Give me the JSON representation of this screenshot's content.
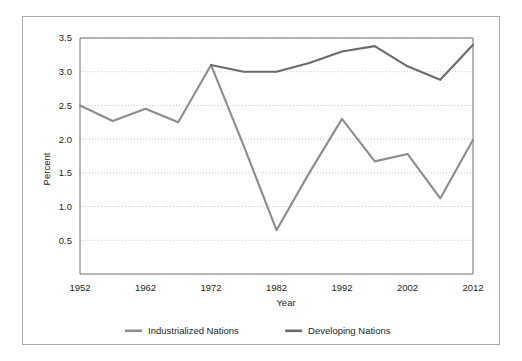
{
  "chart_data": {
    "type": "line",
    "title": "",
    "xlabel": "Year",
    "ylabel": "Percent",
    "xlim": [
      1952,
      2012
    ],
    "ylim": [
      0,
      3.5
    ],
    "xticks": [
      1952,
      1962,
      1972,
      1982,
      1992,
      2002,
      2012
    ],
    "xtick_labels": [
      "1952",
      "1962",
      "1972",
      "1982",
      "1992",
      "2002",
      "2012"
    ],
    "yticks": [
      0.5,
      1.0,
      1.5,
      2.0,
      2.5,
      3.0,
      3.5
    ],
    "ytick_labels": [
      "0.5",
      "1.0",
      "1.5",
      "2.0",
      "2.5",
      "3.0",
      "3.5"
    ],
    "grid": "horizontal-dotted",
    "legend_position": "bottom",
    "x": [
      1952,
      1957,
      1962,
      1967,
      1972,
      1977,
      1982,
      1987,
      1992,
      1997,
      2002,
      2007,
      2012
    ],
    "series": [
      {
        "name": "Industrialized Nations",
        "color": "#8c8c8c",
        "values": [
          2.5,
          2.27,
          2.45,
          2.25,
          3.1,
          1.9,
          0.65,
          1.5,
          2.3,
          1.67,
          1.78,
          1.12,
          1.99
        ]
      },
      {
        "name": "Developing Nations",
        "color": "#6b6b6b",
        "values": [
          null,
          null,
          null,
          null,
          3.1,
          3.0,
          3.0,
          3.13,
          3.3,
          3.38,
          3.08,
          2.88,
          3.4
        ]
      }
    ]
  },
  "legend": {
    "items": [
      {
        "label": "Industrialized Nations",
        "color": "#8c8c8c"
      },
      {
        "label": "Developing Nations",
        "color": "#6b6b6b"
      }
    ]
  },
  "axes": {
    "x_title": "Year",
    "y_title": "Percent"
  }
}
